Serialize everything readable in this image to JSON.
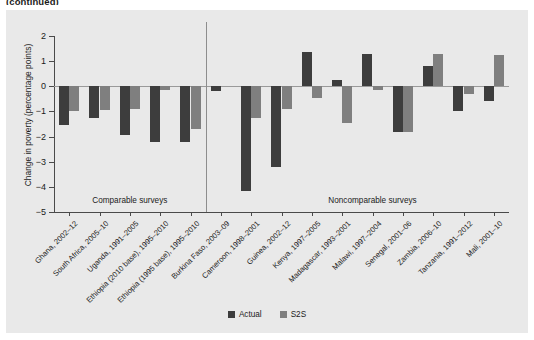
{
  "figure": {
    "title_fragment": "(continued)"
  },
  "legend": {
    "items": [
      {
        "label": "Actual",
        "color": "#3d3d3d",
        "key": "actual"
      },
      {
        "label": "S2S",
        "color": "#7f7f7f",
        "key": "s2s"
      }
    ]
  },
  "annotations": {
    "comparable": "Comparable surveys",
    "noncomparable": "Noncomparable surveys"
  },
  "colors": {
    "panel_background": "#e9e9e9",
    "actual": "#3d3d3d",
    "s2s": "#7f7f7f",
    "axis": "#4a4a4a",
    "zero_line": "#9a9a9a",
    "divider": "#8d8d8d",
    "text": "#1b1b1b"
  },
  "chart_data": {
    "type": "bar",
    "title": "",
    "xlabel": "",
    "ylabel": "Change in poverty (percentage points)",
    "ylim": [
      -5,
      2
    ],
    "yticks": [
      2,
      1,
      0,
      -1,
      -2,
      -3,
      -4,
      -5
    ],
    "ytick_labels": [
      "2",
      "1",
      "0",
      "−1",
      "−2",
      "−3",
      "−4",
      "−5"
    ],
    "grid": false,
    "legend_position": "bottom-center",
    "zero_reference_line": 0,
    "group_divider_after_index": 4,
    "groups": [
      {
        "name": "Comparable surveys",
        "start_index": 0,
        "end_index": 4
      },
      {
        "name": "Noncomparable surveys",
        "start_index": 5,
        "end_index": 15
      }
    ],
    "categories": [
      "Ghana, 2002–12",
      "South Africa, 2005–10",
      "Uganda, 1991–2005",
      "Ethiopia (2010 base), 1995–2010",
      "Ethiopia (1995 base), 1995–2010",
      "Burkina Faso, 2003–09",
      "Cameroon, 1998–2001",
      "Guinea, 2002–12",
      "Kenya, 1997–2005",
      "Madagascar, 1993–2001",
      "Malawi, 1997–2004",
      "Senegal, 2001–06",
      "Zambia, 2006–10",
      "Tanzania, 1991–2012",
      "Mali, 2001–10"
    ],
    "series": [
      {
        "name": "Actual",
        "color": "#3d3d3d",
        "values": [
          -1.55,
          -1.25,
          -1.95,
          -2.2,
          -2.2,
          -0.2,
          -4.15,
          -3.2,
          1.35,
          0.25,
          1.3,
          -1.8,
          0.8,
          -1.0,
          -0.6
        ]
      },
      {
        "name": "S2S",
        "color": "#7f7f7f",
        "values": [
          -1.0,
          -0.95,
          -0.9,
          -0.15,
          -1.7,
          0.0,
          -1.25,
          -0.9,
          -0.45,
          -1.45,
          -0.15,
          -1.8,
          1.3,
          -0.3,
          1.25
        ]
      }
    ]
  }
}
